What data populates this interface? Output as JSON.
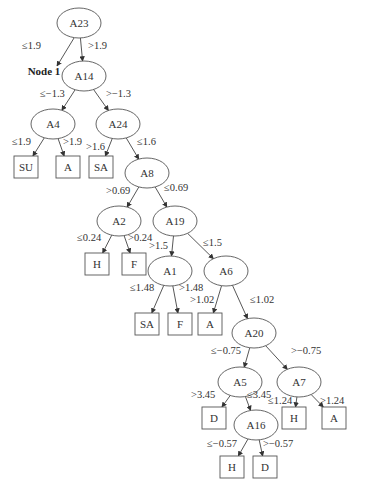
{
  "diagram": {
    "type": "decision-tree",
    "colors": {
      "line": "#444444",
      "text": "#333333",
      "background": "#ffffff"
    },
    "annotation": {
      "id": "node1",
      "text": "Node 1",
      "x": 44,
      "y": 75
    },
    "nodes": [
      {
        "id": "n_a23",
        "label": "A23",
        "kind": "decision",
        "x": 79,
        "y": 23
      },
      {
        "id": "n_a14",
        "label": "A14",
        "kind": "decision",
        "x": 84,
        "y": 76
      },
      {
        "id": "n_a4",
        "label": "A4",
        "kind": "decision",
        "x": 53,
        "y": 124
      },
      {
        "id": "n_a24",
        "label": "A24",
        "kind": "decision",
        "x": 118,
        "y": 124
      },
      {
        "id": "l_su",
        "label": "SU",
        "kind": "leaf",
        "x": 26,
        "y": 167
      },
      {
        "id": "l_a1",
        "label": "A",
        "kind": "leaf",
        "x": 68,
        "y": 167
      },
      {
        "id": "l_sa1",
        "label": "SA",
        "kind": "leaf",
        "x": 101,
        "y": 167
      },
      {
        "id": "n_a8",
        "label": "A8",
        "kind": "decision",
        "x": 147,
        "y": 173
      },
      {
        "id": "n_a2",
        "label": "A2",
        "kind": "decision",
        "x": 119,
        "y": 221
      },
      {
        "id": "n_a19",
        "label": "A19",
        "kind": "decision",
        "x": 175,
        "y": 221
      },
      {
        "id": "l_h1",
        "label": "H",
        "kind": "leaf",
        "x": 97,
        "y": 264
      },
      {
        "id": "l_f1",
        "label": "F",
        "kind": "leaf",
        "x": 134,
        "y": 264
      },
      {
        "id": "n_a1",
        "label": "A1",
        "kind": "decision",
        "x": 170,
        "y": 271
      },
      {
        "id": "n_a6",
        "label": "A6",
        "kind": "decision",
        "x": 226,
        "y": 271
      },
      {
        "id": "l_sa2",
        "label": "SA",
        "kind": "leaf",
        "x": 147,
        "y": 324
      },
      {
        "id": "l_f2",
        "label": "F",
        "kind": "leaf",
        "x": 180,
        "y": 324
      },
      {
        "id": "l_a2",
        "label": "A",
        "kind": "leaf",
        "x": 210,
        "y": 324
      },
      {
        "id": "n_a20",
        "label": "A20",
        "kind": "decision",
        "x": 254,
        "y": 333
      },
      {
        "id": "n_a5",
        "label": "A5",
        "kind": "decision",
        "x": 240,
        "y": 382
      },
      {
        "id": "n_a7",
        "label": "A7",
        "kind": "decision",
        "x": 299,
        "y": 382
      },
      {
        "id": "l_d1",
        "label": "D",
        "kind": "leaf",
        "x": 214,
        "y": 418
      },
      {
        "id": "n_a16",
        "label": "A16",
        "kind": "decision",
        "x": 256,
        "y": 425
      },
      {
        "id": "l_h2",
        "label": "H",
        "kind": "leaf",
        "x": 294,
        "y": 418
      },
      {
        "id": "l_a3",
        "label": "A",
        "kind": "leaf",
        "x": 334,
        "y": 418
      },
      {
        "id": "l_h3",
        "label": "H",
        "kind": "leaf",
        "x": 232,
        "y": 467
      },
      {
        "id": "l_d2",
        "label": "D",
        "kind": "leaf",
        "x": 265,
        "y": 467
      }
    ],
    "edges": [
      {
        "from": "n_a23",
        "to": "node1",
        "label": "≤1.9",
        "lx": 22,
        "ly": 49,
        "x1": 74,
        "y1": 38,
        "x2": 57,
        "y2": 66
      },
      {
        "from": "n_a23",
        "to": "n_a14",
        "label": ">1.9",
        "lx": 88,
        "ly": 49
      },
      {
        "from": "n_a14",
        "to": "n_a4",
        "label": "≤−1.3",
        "lx": 40,
        "ly": 97
      },
      {
        "from": "n_a14",
        "to": "n_a24",
        "label": ">−1.3",
        "lx": 106,
        "ly": 97
      },
      {
        "from": "n_a4",
        "to": "l_su",
        "label": "≤1.9",
        "lx": 12,
        "ly": 145
      },
      {
        "from": "n_a4",
        "to": "l_a1",
        "label": ">1.9",
        "lx": 63,
        "ly": 145
      },
      {
        "from": "n_a24",
        "to": "l_sa1",
        "label": ">1.6",
        "lx": 86,
        "ly": 150
      },
      {
        "from": "n_a24",
        "to": "n_a8",
        "label": "≤1.6",
        "lx": 137,
        "ly": 145
      },
      {
        "from": "n_a8",
        "to": "n_a2",
        "label": ">0.69",
        "lx": 106,
        "ly": 194
      },
      {
        "from": "n_a8",
        "to": "n_a19",
        "label": "≤0.69",
        "lx": 164,
        "ly": 191
      },
      {
        "from": "n_a2",
        "to": "l_h1",
        "label": "≤0.24",
        "lx": 77,
        "ly": 241
      },
      {
        "from": "n_a2",
        "to": "l_f1",
        "label": ">0.24",
        "lx": 128,
        "ly": 241
      },
      {
        "from": "n_a19",
        "to": "n_a1",
        "label": ">1.5",
        "lx": 149,
        "ly": 249
      },
      {
        "from": "n_a19",
        "to": "n_a6",
        "label": "≤1.5",
        "lx": 203,
        "ly": 246
      },
      {
        "from": "n_a1",
        "to": "l_sa2",
        "label": "≤1.48",
        "lx": 130,
        "ly": 291
      },
      {
        "from": "n_a1",
        "to": "l_f2",
        "label": ">1.48",
        "lx": 179,
        "ly": 291
      },
      {
        "from": "n_a6",
        "to": "l_a2",
        "label": ">1.02",
        "lx": 190,
        "ly": 303
      },
      {
        "from": "n_a6",
        "to": "n_a20",
        "label": "≤1.02",
        "lx": 250,
        "ly": 303
      },
      {
        "from": "n_a20",
        "to": "n_a5",
        "label": "≤−0.75",
        "lx": 211,
        "ly": 354
      },
      {
        "from": "n_a20",
        "to": "n_a7",
        "label": ">−0.75",
        "lx": 291,
        "ly": 354
      },
      {
        "from": "n_a5",
        "to": "l_d1",
        "label": ">3.45",
        "lx": 191,
        "ly": 398
      },
      {
        "from": "n_a5",
        "to": "n_a16",
        "label": "≤3.45",
        "lx": 247,
        "ly": 398
      },
      {
        "from": "n_a7",
        "to": "l_h2",
        "label": "≤1.24",
        "lx": 268,
        "ly": 404
      },
      {
        "from": "n_a7",
        "to": "l_a3",
        "label": ">1.24",
        "lx": 320,
        "ly": 404
      },
      {
        "from": "n_a16",
        "to": "l_h3",
        "label": "≤−0.57",
        "lx": 207,
        "ly": 447
      },
      {
        "from": "n_a16",
        "to": "l_d2",
        "label": ">−0.57",
        "lx": 263,
        "ly": 447
      }
    ]
  }
}
